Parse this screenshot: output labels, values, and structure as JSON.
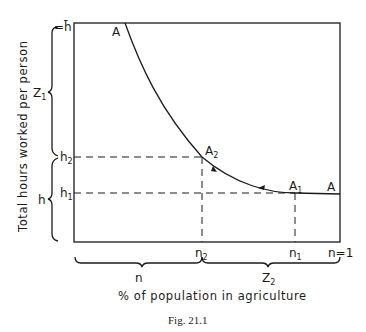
{
  "figure": {
    "caption": "Fig. 21.1",
    "x_axis_title": "% of population in agriculture",
    "y_axis_title": "Total hours worked per person"
  },
  "y_ticks": {
    "h_bar": "=h̄",
    "h2": "h",
    "h2_sub": "2",
    "h1": "h",
    "h1_sub": "1"
  },
  "x_ticks": {
    "n2": "n",
    "n2_sub": "2",
    "n1": "n",
    "n1_sub": "1",
    "n_minus_1": "n=1"
  },
  "braces": {
    "left_upper": "Z",
    "left_upper_sub": "1",
    "left_lower": "h",
    "bottom_left": "n",
    "bottom_right": "Z",
    "bottom_right_sub": "2"
  },
  "points": {
    "A_top": "A",
    "A2": "A",
    "A2_sub": "2",
    "A1": "A",
    "A1_sub": "1",
    "A_right": "A"
  }
}
